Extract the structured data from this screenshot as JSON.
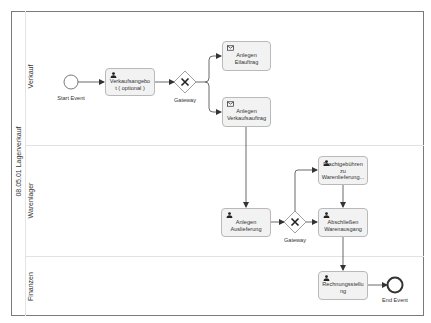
{
  "pool": {
    "label": "08.05.01 Lagerverkauf"
  },
  "lanes": [
    {
      "label": "Verkauf"
    },
    {
      "label": "Warenlager"
    },
    {
      "label": "Finanzen"
    }
  ],
  "events": {
    "start": {
      "label": "Start Event",
      "type": "start-event"
    },
    "end": {
      "label": "End Event",
      "type": "end-event"
    }
  },
  "gateways": [
    {
      "label": "Gateway",
      "type": "exclusive-gateway"
    },
    {
      "label": "Gateway",
      "type": "exclusive-gateway"
    }
  ],
  "tasks": [
    {
      "label": "Verkaufsangebo t ( optional )",
      "line1": "Verkaufsangebo",
      "line2": "t ( optional )",
      "icon": "user-icon",
      "lane": "Verkauf"
    },
    {
      "label": "Anlegen Eilauftrag",
      "line1": "Anlegen",
      "line2": "Eilauftrag",
      "icon": "envelope-icon",
      "lane": "Verkauf"
    },
    {
      "label": "Anlegen Verkaufsauftrag",
      "line1": "Anlegen",
      "line2": "Verkaufsauftrag",
      "icon": "envelope-icon",
      "lane": "Verkauf"
    },
    {
      "label": "Anlegen Auslieferung",
      "line1": "Anlegen",
      "line2": "Auslieferung",
      "icon": "user-icon",
      "lane": "Warenlager"
    },
    {
      "label": "Frachtgebühren zu Warenlieferung...",
      "line1": "Frachtgebühren",
      "line2": "zu",
      "line3": "Warenlieferung...",
      "icon": "user-icon",
      "lane": "Warenlager"
    },
    {
      "label": "Abschließen Warenausgang",
      "line1": "Abschließen",
      "line2": "Warenausgang",
      "icon": "user-icon",
      "lane": "Warenlager"
    },
    {
      "label": "Rechnungsstellu ng",
      "line1": "Rechnungsstellu",
      "line2": "ng",
      "icon": "user-icon",
      "lane": "Finanzen"
    }
  ],
  "colors": {
    "pool_border": "#7a7a7a",
    "task_fill": "#f2f2f2",
    "task_border": "#b9b9b9",
    "flow": "#444444",
    "lane_divider": "#e2e2e2"
  }
}
